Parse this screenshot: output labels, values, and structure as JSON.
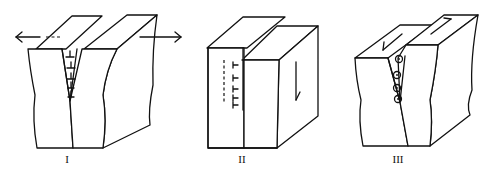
{
  "diagram": {
    "type": "fracture-modes",
    "line_color": "#111111",
    "background": "#ffffff",
    "panels": [
      {
        "id": "mode-1",
        "label": "I",
        "description": "opening mode with edge dislocations, horizontal tensile arrows"
      },
      {
        "id": "mode-2",
        "label": "II",
        "description": "sliding mode with edge dislocations, vertical shear arrow on face"
      },
      {
        "id": "mode-3",
        "label": "III",
        "description": "tearing mode with screw dislocations, antiparallel arrows on top faces"
      }
    ]
  }
}
